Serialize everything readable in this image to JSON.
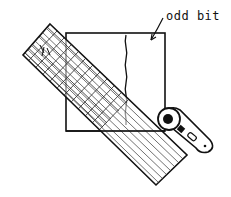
{
  "illustration": {
    "subject": "quilting ruler over fabric square with rotary cutter",
    "annotation": "odd bit",
    "colors": {
      "ink": "#111111",
      "paper": "#ffffff"
    },
    "parts": [
      "ruler-grid",
      "fabric-square",
      "wavy-cut-line",
      "rotary-cutter",
      "odd-bit-arrow"
    ]
  }
}
